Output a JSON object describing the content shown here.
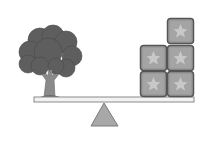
{
  "scene": {
    "title": "Balance scale: tree vs. star blocks",
    "left_pan": {
      "object": "tree",
      "count": 1
    },
    "right_pan": {
      "object": "star-block",
      "count": 5,
      "arrangement": "2 columns: left column 2 blocks, right column 3 blocks"
    },
    "balance_state": "level"
  },
  "colors": {
    "background": "#ffffff",
    "tree_canopy": "#5e5e5e",
    "tree_trunk": "#8a8a8a",
    "plank_fill": "#f2f2f2",
    "plank_stroke": "#8a8a8a",
    "fulcrum_fill": "#a8a8a8",
    "fulcrum_stroke": "#7a7a7a",
    "block_fill": "#9a9a9a",
    "block_stroke": "#555555",
    "star_fill": "#c8c8c8"
  },
  "icons": [
    "tree-icon",
    "star-block-icon",
    "fulcrum-icon",
    "plank-icon"
  ]
}
